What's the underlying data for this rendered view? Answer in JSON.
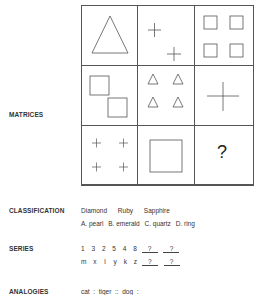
{
  "sections": {
    "matrices": {
      "label": "MATRICES",
      "question_mark": "?"
    },
    "classification": {
      "label": "CLASSIFICATION",
      "words": [
        "Diamond",
        "Ruby",
        "Sapphire"
      ],
      "options": [
        "A. pearl",
        "B. emerald",
        "C. quartz",
        "D. ring"
      ]
    },
    "series": {
      "label": "SERIES",
      "row1": [
        "1",
        "3",
        "2",
        "5",
        "4",
        "8"
      ],
      "row2": [
        "m",
        "x",
        "l",
        "y",
        "k",
        "z"
      ],
      "blank": "?"
    },
    "analogies": {
      "label": "ANALOGIES",
      "text": "cat  :  tiger  ::  dog  :"
    }
  }
}
